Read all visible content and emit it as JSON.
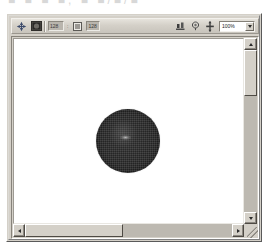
{
  "page": {
    "background_color": "#ffffff",
    "cut_off_caption": "■ ■ ■  ■, ■ ■/■/■"
  },
  "window": {
    "frame_color": "#d4d0c8",
    "name": "image-editor-window"
  },
  "toolbar": {
    "name": "main-toolbar",
    "background_color": "#d4d0c8",
    "left_tools": [
      {
        "name": "move-arrow-icon",
        "glyph": "arrow",
        "label": "Move"
      },
      {
        "name": "image-thumbnail-icon",
        "glyph": "thumbnail",
        "label": "Image"
      }
    ],
    "fields": [
      {
        "name": "coordinate-field-x",
        "value": "128"
      },
      {
        "name": "coordinate-separator",
        "value": ":"
      },
      {
        "name": "layer-icon-field",
        "value": ""
      },
      {
        "name": "coordinate-field-y",
        "value": "128"
      }
    ],
    "right_tools": [
      {
        "name": "measure-tool-icon",
        "glyph": "measure",
        "label": "Measure"
      },
      {
        "name": "color-picker-icon",
        "glyph": "picker",
        "label": "Color Picker"
      },
      {
        "name": "hand-tool-icon",
        "glyph": "hand",
        "label": "Hand"
      }
    ],
    "zoom": {
      "name": "zoom-combobox",
      "value": "100%",
      "options": [
        "25%",
        "50%",
        "100%",
        "200%",
        "400%"
      ]
    }
  },
  "canvas": {
    "name": "image-canvas",
    "background_color": "#ffffff",
    "object": {
      "name": "rendered-sphere",
      "shape": "circle",
      "fill_color": "#232323",
      "highlight_color": "#d2d2d2",
      "rim_color": "#8e8e8e",
      "diameter_px": 64,
      "center_x_px": 114,
      "center_y_px": 102
    }
  },
  "scrollbars": {
    "vertical": {
      "name": "vertical-scrollbar",
      "up_label": "▲",
      "down_label": "▼",
      "thumb_name": "vertical-scrollbar-thumb"
    },
    "horizontal": {
      "name": "horizontal-scrollbar",
      "left_label": "◀",
      "right_label": "▶",
      "thumb_name": "horizontal-scrollbar-thumb"
    }
  }
}
